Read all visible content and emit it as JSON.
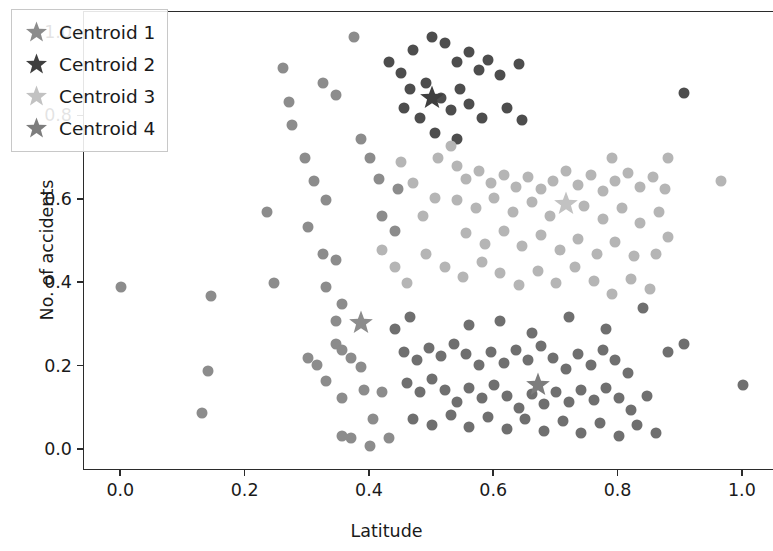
{
  "chart_data": {
    "type": "scatter",
    "title": "",
    "xlabel": "Latitude",
    "ylabel": "No. of accidents",
    "xlim": [
      -0.06,
      1.05
    ],
    "ylim": [
      -0.05,
      1.05
    ],
    "xticks": [
      0.0,
      0.2,
      0.4,
      0.6,
      0.8,
      1.0
    ],
    "xtick_labels": [
      "0.0",
      "0.2",
      "0.4",
      "0.6",
      "0.8",
      "1.0"
    ],
    "yticks": [
      0.0,
      0.2,
      0.4,
      0.6,
      0.8,
      1.0
    ],
    "ytick_labels": [
      "0.0",
      "0.2",
      "0.4",
      "0.6",
      "0.8",
      "1.0"
    ],
    "grid": false,
    "legend_position": "upper left",
    "marker": "circle",
    "marker_size": 11,
    "colors": {
      "cluster_1": "#8c8c8c",
      "cluster_2": "#4d4d4d",
      "cluster_3": "#b5b5b5",
      "cluster_4": "#6f6f6f",
      "axis": "#2b2b2b",
      "text": "#1a1a1a",
      "background": "#ffffff"
    },
    "series": [
      {
        "name": "Cluster 1",
        "color": "#8c8c8c",
        "centroid": [
          0.385,
          0.305
        ],
        "points": [
          [
            0.0,
            0.39
          ],
          [
            0.145,
            0.37
          ],
          [
            0.245,
            0.4
          ],
          [
            0.14,
            0.19
          ],
          [
            0.13,
            0.09
          ],
          [
            0.235,
            0.57
          ],
          [
            0.3,
            0.535
          ],
          [
            0.325,
            0.47
          ],
          [
            0.345,
            0.455
          ],
          [
            0.33,
            0.39
          ],
          [
            0.3,
            0.22
          ],
          [
            0.315,
            0.205
          ],
          [
            0.345,
            0.255
          ],
          [
            0.33,
            0.165
          ],
          [
            0.355,
            0.24
          ],
          [
            0.37,
            0.22
          ],
          [
            0.385,
            0.2
          ],
          [
            0.355,
            0.125
          ],
          [
            0.39,
            0.145
          ],
          [
            0.42,
            0.14
          ],
          [
            0.405,
            0.075
          ],
          [
            0.355,
            0.035
          ],
          [
            0.37,
            0.03
          ],
          [
            0.43,
            0.03
          ],
          [
            0.4,
            0.01
          ],
          [
            0.345,
            0.31
          ],
          [
            0.355,
            0.35
          ],
          [
            0.33,
            0.6
          ],
          [
            0.31,
            0.645
          ],
          [
            0.295,
            0.7
          ],
          [
            0.275,
            0.78
          ],
          [
            0.27,
            0.835
          ],
          [
            0.26,
            0.915
          ],
          [
            0.325,
            0.88
          ],
          [
            0.345,
            0.85
          ],
          [
            0.385,
            0.745
          ],
          [
            0.4,
            0.7
          ],
          [
            0.415,
            0.65
          ],
          [
            0.445,
            0.625
          ],
          [
            0.42,
            0.56
          ],
          [
            0.44,
            0.525
          ],
          [
            0.375,
            0.99
          ]
        ]
      },
      {
        "name": "Cluster 2",
        "color": "#4d4d4d",
        "centroid": [
          0.5,
          0.845
        ],
        "points": [
          [
            0.47,
            0.96
          ],
          [
            0.5,
            0.99
          ],
          [
            0.52,
            0.975
          ],
          [
            0.54,
            0.93
          ],
          [
            0.56,
            0.955
          ],
          [
            0.575,
            0.91
          ],
          [
            0.59,
            0.935
          ],
          [
            0.61,
            0.9
          ],
          [
            0.64,
            0.925
          ],
          [
            0.45,
            0.905
          ],
          [
            0.465,
            0.865
          ],
          [
            0.49,
            0.88
          ],
          [
            0.515,
            0.845
          ],
          [
            0.53,
            0.815
          ],
          [
            0.545,
            0.865
          ],
          [
            0.56,
            0.83
          ],
          [
            0.58,
            0.795
          ],
          [
            0.43,
            0.93
          ],
          [
            0.505,
            0.76
          ],
          [
            0.54,
            0.745
          ],
          [
            0.48,
            0.795
          ],
          [
            0.905,
            0.855
          ],
          [
            0.62,
            0.82
          ],
          [
            0.645,
            0.79
          ],
          [
            0.455,
            0.82
          ]
        ]
      },
      {
        "name": "Cluster 3",
        "color": "#b5b5b5",
        "centroid": [
          0.715,
          0.59
        ],
        "points": [
          [
            0.54,
            0.68
          ],
          [
            0.555,
            0.65
          ],
          [
            0.575,
            0.67
          ],
          [
            0.595,
            0.64
          ],
          [
            0.615,
            0.66
          ],
          [
            0.635,
            0.63
          ],
          [
            0.655,
            0.655
          ],
          [
            0.675,
            0.625
          ],
          [
            0.695,
            0.645
          ],
          [
            0.715,
            0.67
          ],
          [
            0.735,
            0.635
          ],
          [
            0.755,
            0.66
          ],
          [
            0.775,
            0.62
          ],
          [
            0.795,
            0.645
          ],
          [
            0.815,
            0.665
          ],
          [
            0.835,
            0.63
          ],
          [
            0.855,
            0.655
          ],
          [
            0.875,
            0.625
          ],
          [
            0.965,
            0.645
          ],
          [
            0.54,
            0.6
          ],
          [
            0.57,
            0.58
          ],
          [
            0.6,
            0.605
          ],
          [
            0.63,
            0.57
          ],
          [
            0.66,
            0.595
          ],
          [
            0.69,
            0.56
          ],
          [
            0.745,
            0.585
          ],
          [
            0.775,
            0.555
          ],
          [
            0.805,
            0.58
          ],
          [
            0.835,
            0.545
          ],
          [
            0.865,
            0.57
          ],
          [
            0.555,
            0.52
          ],
          [
            0.585,
            0.495
          ],
          [
            0.615,
            0.525
          ],
          [
            0.645,
            0.49
          ],
          [
            0.675,
            0.515
          ],
          [
            0.705,
            0.48
          ],
          [
            0.735,
            0.505
          ],
          [
            0.765,
            0.47
          ],
          [
            0.795,
            0.5
          ],
          [
            0.825,
            0.465
          ],
          [
            0.485,
            0.56
          ],
          [
            0.505,
            0.605
          ],
          [
            0.47,
            0.64
          ],
          [
            0.45,
            0.69
          ],
          [
            0.51,
            0.7
          ],
          [
            0.53,
            0.73
          ],
          [
            0.49,
            0.47
          ],
          [
            0.52,
            0.44
          ],
          [
            0.55,
            0.415
          ],
          [
            0.58,
            0.45
          ],
          [
            0.61,
            0.425
          ],
          [
            0.64,
            0.395
          ],
          [
            0.67,
            0.43
          ],
          [
            0.7,
            0.4
          ],
          [
            0.73,
            0.44
          ],
          [
            0.76,
            0.405
          ],
          [
            0.79,
            0.375
          ],
          [
            0.82,
            0.41
          ],
          [
            0.85,
            0.385
          ],
          [
            0.46,
            0.4
          ],
          [
            0.44,
            0.44
          ],
          [
            0.42,
            0.48
          ],
          [
            0.86,
            0.47
          ],
          [
            0.88,
            0.51
          ],
          [
            0.88,
            0.7
          ],
          [
            0.79,
            0.7
          ]
        ]
      },
      {
        "name": "Cluster 4",
        "color": "#6f6f6f",
        "centroid": [
          0.67,
          0.155
        ],
        "points": [
          [
            0.455,
            0.235
          ],
          [
            0.475,
            0.215
          ],
          [
            0.495,
            0.245
          ],
          [
            0.515,
            0.225
          ],
          [
            0.535,
            0.255
          ],
          [
            0.555,
            0.23
          ],
          [
            0.575,
            0.205
          ],
          [
            0.595,
            0.235
          ],
          [
            0.615,
            0.21
          ],
          [
            0.635,
            0.24
          ],
          [
            0.655,
            0.215
          ],
          [
            0.675,
            0.25
          ],
          [
            0.695,
            0.22
          ],
          [
            0.715,
            0.195
          ],
          [
            0.735,
            0.23
          ],
          [
            0.755,
            0.205
          ],
          [
            0.775,
            0.24
          ],
          [
            0.795,
            0.215
          ],
          [
            0.815,
            0.185
          ],
          [
            0.46,
            0.16
          ],
          [
            0.48,
            0.14
          ],
          [
            0.5,
            0.17
          ],
          [
            0.52,
            0.145
          ],
          [
            0.54,
            0.115
          ],
          [
            0.56,
            0.15
          ],
          [
            0.58,
            0.125
          ],
          [
            0.6,
            0.155
          ],
          [
            0.62,
            0.13
          ],
          [
            0.64,
            0.1
          ],
          [
            0.66,
            0.135
          ],
          [
            0.68,
            0.11
          ],
          [
            0.7,
            0.14
          ],
          [
            0.72,
            0.115
          ],
          [
            0.74,
            0.145
          ],
          [
            0.76,
            0.12
          ],
          [
            0.78,
            0.15
          ],
          [
            0.8,
            0.125
          ],
          [
            0.82,
            0.095
          ],
          [
            0.845,
            0.13
          ],
          [
            0.47,
            0.075
          ],
          [
            0.5,
            0.06
          ],
          [
            0.53,
            0.085
          ],
          [
            0.56,
            0.055
          ],
          [
            0.59,
            0.08
          ],
          [
            0.62,
            0.05
          ],
          [
            0.65,
            0.075
          ],
          [
            0.68,
            0.045
          ],
          [
            0.71,
            0.07
          ],
          [
            0.74,
            0.04
          ],
          [
            0.77,
            0.065
          ],
          [
            0.8,
            0.035
          ],
          [
            0.83,
            0.06
          ],
          [
            0.86,
            0.04
          ],
          [
            0.44,
            0.29
          ],
          [
            0.465,
            0.32
          ],
          [
            0.56,
            0.3
          ],
          [
            0.61,
            0.31
          ],
          [
            0.66,
            0.28
          ],
          [
            0.72,
            0.32
          ],
          [
            0.78,
            0.29
          ],
          [
            0.84,
            0.34
          ],
          [
            0.88,
            0.235
          ],
          [
            1.0,
            0.155
          ],
          [
            0.905,
            0.255
          ]
        ]
      }
    ]
  },
  "legend": {
    "entries": [
      {
        "label": "Centroid 1",
        "color": "#8c8c8c",
        "marker": "star-icon"
      },
      {
        "label": "Centroid 2",
        "color": "#3f3f3f",
        "marker": "star-icon"
      },
      {
        "label": "Centroid 3",
        "color": "#c2c2c2",
        "marker": "star-icon"
      },
      {
        "label": "Centroid 4",
        "color": "#7d7d7d",
        "marker": "star-icon"
      }
    ]
  }
}
